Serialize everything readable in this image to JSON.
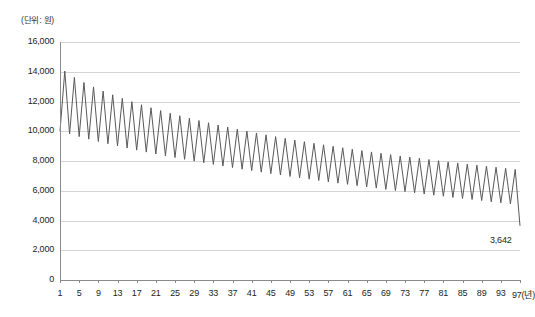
{
  "chart_data": {
    "type": "line",
    "title": "",
    "subtitle": "",
    "unit_label": "(단위: 원)",
    "xlabel": "(년)",
    "ylabel": "",
    "xlim": [
      1,
      97
    ],
    "ylim": [
      0,
      16000
    ],
    "grid": true,
    "legend": null,
    "y_ticks": [
      0,
      2000,
      4000,
      6000,
      8000,
      10000,
      12000,
      14000,
      16000
    ],
    "y_tick_labels": [
      "0",
      "2,000",
      "4,000",
      "6,000",
      "8,000",
      "10,000",
      "12,000",
      "14,000",
      "16,000"
    ],
    "x_ticks": [
      1,
      5,
      9,
      13,
      17,
      21,
      25,
      29,
      33,
      37,
      41,
      45,
      49,
      53,
      57,
      61,
      65,
      69,
      73,
      77,
      81,
      85,
      89,
      93,
      97
    ],
    "x_tick_labels": [
      "1",
      "5",
      "9",
      "13",
      "17",
      "21",
      "25",
      "29",
      "33",
      "37",
      "41",
      "45",
      "49",
      "53",
      "57",
      "61",
      "65",
      "69",
      "73",
      "77",
      "81",
      "85",
      "89",
      "93",
      "97"
    ],
    "x_axis_unit_suffix": "(년)",
    "line_color": "#595959",
    "grid_color": "#d4d4d4",
    "axis_color": "#8a8a8a",
    "annotations": [
      {
        "text": "3,642",
        "x": 97,
        "y": 3642
      }
    ],
    "x": [
      1,
      2,
      3,
      4,
      5,
      6,
      7,
      8,
      9,
      10,
      11,
      12,
      13,
      14,
      15,
      16,
      17,
      18,
      19,
      20,
      21,
      22,
      23,
      24,
      25,
      26,
      27,
      28,
      29,
      30,
      31,
      32,
      33,
      34,
      35,
      36,
      37,
      38,
      39,
      40,
      41,
      42,
      43,
      44,
      45,
      46,
      47,
      48,
      49,
      50,
      51,
      52,
      53,
      54,
      55,
      56,
      57,
      58,
      59,
      60,
      61,
      62,
      63,
      64,
      65,
      66,
      67,
      68,
      69,
      70,
      71,
      72,
      73,
      74,
      75,
      76,
      77,
      78,
      79,
      80,
      81,
      82,
      83,
      84,
      85,
      86,
      87,
      88,
      89,
      90,
      91,
      92,
      93,
      94,
      95,
      96,
      97
    ],
    "values": [
      10000,
      14050,
      9820,
      13620,
      9640,
      13280,
      9470,
      12980,
      9310,
      12700,
      9160,
      12450,
      9010,
      12210,
      8870,
      11990,
      8730,
      11780,
      8600,
      11580,
      8470,
      11390,
      8350,
      11210,
      8230,
      11040,
      8110,
      10880,
      7990,
      10720,
      7880,
      10570,
      7770,
      10420,
      7660,
      10280,
      7560,
      10140,
      7450,
      10010,
      7350,
      9880,
      7250,
      9760,
      7150,
      9640,
      7060,
      9520,
      6960,
      9410,
      6870,
      9300,
      6780,
      9190,
      6690,
      9090,
      6600,
      8990,
      6510,
      8890,
      6430,
      8790,
      6340,
      8700,
      6260,
      8610,
      6180,
      8520,
      6090,
      8430,
      6010,
      8340,
      5940,
      8260,
      5860,
      8180,
      5780,
      8100,
      5700,
      8020,
      5630,
      7940,
      5550,
      7870,
      5480,
      7790,
      5410,
      7720,
      5340,
      7650,
      5260,
      7580,
      5190,
      7510,
      5120,
      7440,
      3642
    ]
  }
}
